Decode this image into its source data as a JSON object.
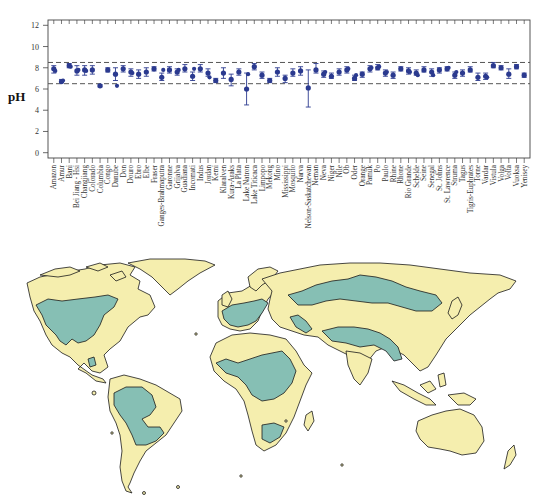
{
  "chart_data": {
    "type": "scatter",
    "title": "",
    "xlabel": "",
    "ylabel": "pH",
    "ylim": [
      -0.5,
      12.5
    ],
    "yticks": [
      0,
      2,
      4,
      6,
      8,
      10,
      12
    ],
    "reference_lines": [
      {
        "y": 8.5,
        "style": "dashed",
        "color": "#555555"
      },
      {
        "y": 6.5,
        "style": "dashed",
        "color": "#555555"
      }
    ],
    "marker_color": "#2b3a8f",
    "categories": [
      "Amazon",
      "Amur",
      "Bani",
      "Bei Jiang - Hsi",
      "Changjiang",
      "Colorado",
      "Columbia",
      "Congo",
      "Danube",
      "Don",
      "Douro",
      "Ebro",
      "Elbe",
      "Fraser",
      "Ganges-Brahmaputra",
      "Garonne",
      "Grijalva",
      "Guadiana",
      "Incomati",
      "Indus",
      "Jordan",
      "Kemi",
      "Klaralven",
      "Kura-Araks",
      "La Plata",
      "Lake Natron",
      "Lake Titicaca",
      "Limpopo",
      "Mekong",
      "Mino",
      "Mississippi",
      "Mosquito",
      "Narva",
      "Nelson-Saskatchewan",
      "Neman",
      "Neva",
      "Niger",
      "Nile",
      "Ob",
      "Oder",
      "Orange",
      "Pamuk",
      "Po",
      "Paulo",
      "Rhine",
      "Rhone",
      "Rio Grande",
      "Schelde",
      "Seine",
      "Senegal",
      "St. Johns",
      "St. Lawrence",
      "Struma",
      "Tagus",
      "Tigris-Euphrates",
      "Torne",
      "Vardar",
      "Vistula",
      "Volga",
      "Volta",
      "Vuoksa",
      "Yenisey"
    ],
    "series": [
      {
        "name": "pH",
        "points": [
          {
            "mean": 7.9,
            "lo": 7.5,
            "hi": 8.2,
            "extra": [
              7.7
            ]
          },
          {
            "mean": 6.7,
            "lo": 6.6,
            "hi": 6.9,
            "extra": [
              6.8
            ]
          },
          {
            "mean": 8.2,
            "lo": 8.0,
            "hi": 8.4,
            "extra": [
              8.1
            ]
          },
          {
            "mean": 7.7,
            "lo": 7.3,
            "hi": 8.2,
            "extra": [
              7.8
            ]
          },
          {
            "mean": 7.8,
            "lo": 7.3,
            "hi": 8.2,
            "extra": [
              7.7
            ]
          },
          {
            "mean": 7.8,
            "lo": 7.4,
            "hi": 8.2,
            "extra": []
          },
          {
            "mean": 6.3,
            "lo": 6.2,
            "hi": 6.4,
            "extra": []
          },
          {
            "mean": 7.8,
            "lo": 7.6,
            "hi": 8.0,
            "extra": []
          },
          {
            "mean": 7.4,
            "lo": 6.8,
            "hi": 8.0,
            "extra": [
              6.3
            ]
          },
          {
            "mean": 7.9,
            "lo": 7.6,
            "hi": 8.2,
            "extra": []
          },
          {
            "mean": 7.6,
            "lo": 7.2,
            "hi": 7.9,
            "extra": [
              7.5
            ]
          },
          {
            "mean": 7.4,
            "lo": 7.0,
            "hi": 7.8,
            "extra": []
          },
          {
            "mean": 7.6,
            "lo": 7.2,
            "hi": 8.0,
            "extra": []
          },
          {
            "mean": 7.9,
            "lo": 7.7,
            "hi": 8.1,
            "extra": []
          },
          {
            "mean": 7.1,
            "lo": 6.8,
            "hi": 7.5,
            "extra": [
              7.8
            ]
          },
          {
            "mean": 7.8,
            "lo": 7.5,
            "hi": 8.1,
            "extra": []
          },
          {
            "mean": 7.6,
            "lo": 7.3,
            "hi": 7.9,
            "extra": [
              7.8
            ]
          },
          {
            "mean": 7.9,
            "lo": 7.6,
            "hi": 8.3,
            "extra": []
          },
          {
            "mean": 7.2,
            "lo": 6.8,
            "hi": 7.6,
            "extra": [
              7.9
            ]
          },
          {
            "mean": 7.9,
            "lo": 7.6,
            "hi": 8.3,
            "extra": []
          },
          {
            "mean": 7.5,
            "lo": 7.2,
            "hi": 7.9,
            "extra": [
              7.1
            ]
          },
          {
            "mean": 6.8,
            "lo": 6.6,
            "hi": 7.0,
            "extra": []
          },
          {
            "mean": 7.5,
            "lo": 7.0,
            "hi": 8.0,
            "extra": []
          },
          {
            "mean": 6.9,
            "lo": 6.3,
            "hi": 7.4,
            "extra": []
          },
          {
            "mean": 7.6,
            "lo": 7.3,
            "hi": 7.9,
            "extra": []
          },
          {
            "mean": 6.0,
            "lo": 4.5,
            "hi": 7.5,
            "extra": [
              7.4
            ]
          },
          {
            "mean": 8.1,
            "lo": 7.8,
            "hi": 8.4,
            "extra": []
          },
          {
            "mean": 7.3,
            "lo": 7.0,
            "hi": 7.6,
            "extra": []
          },
          {
            "mean": 6.8,
            "lo": 6.6,
            "hi": 7.0,
            "extra": []
          },
          {
            "mean": 7.6,
            "lo": 7.2,
            "hi": 8.0,
            "extra": []
          },
          {
            "mean": 7.0,
            "lo": 6.6,
            "hi": 7.3,
            "extra": []
          },
          {
            "mean": 7.5,
            "lo": 7.2,
            "hi": 7.9,
            "extra": []
          },
          {
            "mean": 7.7,
            "lo": 7.3,
            "hi": 8.1,
            "extra": []
          },
          {
            "mean": 6.1,
            "lo": 4.3,
            "hi": 7.8,
            "extra": []
          },
          {
            "mean": 7.8,
            "lo": 7.5,
            "hi": 8.4,
            "extra": []
          },
          {
            "mean": 7.4,
            "lo": 7.1,
            "hi": 7.7,
            "extra": [
              7.6
            ]
          },
          {
            "mean": 7.2,
            "lo": 7.0,
            "hi": 7.5,
            "extra": []
          },
          {
            "mean": 7.6,
            "lo": 7.3,
            "hi": 7.9,
            "extra": []
          },
          {
            "mean": 7.8,
            "lo": 7.5,
            "hi": 8.1,
            "extra": [
              7.9
            ]
          },
          {
            "mean": 7.0,
            "lo": 6.8,
            "hi": 7.3,
            "extra": [
              7.3
            ]
          },
          {
            "mean": 7.4,
            "lo": 7.1,
            "hi": 7.6,
            "extra": []
          },
          {
            "mean": 7.9,
            "lo": 7.6,
            "hi": 8.2,
            "extra": [
              8.0
            ]
          },
          {
            "mean": 8.0,
            "lo": 7.8,
            "hi": 8.3,
            "extra": [
              8.1
            ]
          },
          {
            "mean": 7.5,
            "lo": 7.2,
            "hi": 7.8,
            "extra": [
              7.6
            ]
          },
          {
            "mean": 7.3,
            "lo": 7.0,
            "hi": 7.6,
            "extra": []
          },
          {
            "mean": 7.9,
            "lo": 7.7,
            "hi": 8.1,
            "extra": []
          },
          {
            "mean": 7.7,
            "lo": 7.4,
            "hi": 8.0,
            "extra": [
              7.6
            ]
          },
          {
            "mean": 7.5,
            "lo": 7.3,
            "hi": 7.8,
            "extra": [
              7.3
            ]
          },
          {
            "mean": 7.8,
            "lo": 7.6,
            "hi": 8.1,
            "extra": []
          },
          {
            "mean": 7.6,
            "lo": 7.2,
            "hi": 7.9,
            "extra": [
              7.3
            ]
          },
          {
            "mean": 7.8,
            "lo": 7.5,
            "hi": 8.0,
            "extra": []
          },
          {
            "mean": 7.9,
            "lo": 7.7,
            "hi": 8.1,
            "extra": [
              8.0
            ]
          },
          {
            "mean": 7.3,
            "lo": 7.0,
            "hi": 7.6,
            "extra": [
              7.6
            ]
          },
          {
            "mean": 7.5,
            "lo": 7.2,
            "hi": 7.8,
            "extra": []
          },
          {
            "mean": 7.8,
            "lo": 7.6,
            "hi": 8.1,
            "extra": []
          },
          {
            "mean": 7.1,
            "lo": 6.8,
            "hi": 7.5,
            "extra": []
          },
          {
            "mean": 7.2,
            "lo": 6.9,
            "hi": 7.5,
            "extra": [
              7.1
            ]
          },
          {
            "mean": 8.2,
            "lo": 8.0,
            "hi": 8.5,
            "extra": []
          },
          {
            "mean": 8.0,
            "lo": 7.8,
            "hi": 8.2,
            "extra": []
          },
          {
            "mean": 7.4,
            "lo": 7.0,
            "hi": 7.9,
            "extra": []
          },
          {
            "mean": 8.1,
            "lo": 7.9,
            "hi": 8.3,
            "extra": []
          },
          {
            "mean": 7.3,
            "lo": 7.1,
            "hi": 7.5,
            "extra": []
          },
          {
            "mean": 8.0,
            "lo": 7.7,
            "hi": 8.3,
            "extra": [
              8.1
            ]
          },
          {
            "mean": 8.1,
            "lo": 7.9,
            "hi": 8.4,
            "extra": []
          },
          {
            "mean": 7.9,
            "lo": 7.6,
            "hi": 8.2,
            "extra": []
          },
          {
            "mean": 7.2,
            "lo": 7.0,
            "hi": 7.5,
            "extra": []
          },
          {
            "mean": 7.1,
            "lo": 7.0,
            "hi": 7.2,
            "extra": []
          },
          {
            "mean": 7.7,
            "lo": 7.4,
            "hi": 8.0,
            "extra": [
              7.8
            ]
          }
        ]
      }
    ],
    "legend": null,
    "grid": false
  },
  "map": {
    "description": "World map with river basins",
    "land_color": "#f5eeae",
    "basin_color": "#86bfb4",
    "outline_color": "#1a1a1a",
    "ocean_color": "#ffffff"
  }
}
